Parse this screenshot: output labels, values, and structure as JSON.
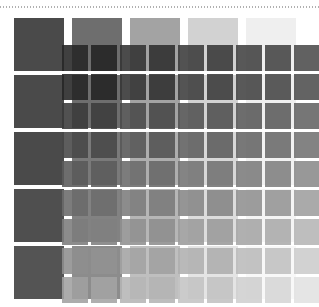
{
  "figure": {
    "background_color": "#ffffff"
  },
  "rule": {
    "name": "dotted-rule",
    "color": "#b0b0b0",
    "y": 6,
    "style": "dotted"
  },
  "chart_data": {
    "type": "heatmap",
    "xlabel": "",
    "ylabel": "",
    "grid": true,
    "legend": null,
    "layers": [
      {
        "name": "coarse",
        "rows": 5,
        "cols": 5,
        "origin_x": 14,
        "origin_y": 18,
        "cell_w": 50,
        "cell_h": 53,
        "gap_x": 8,
        "gap_y": 4,
        "opacity": 1,
        "values": [
          [
            "#4a4a4a",
            "#6e6e6e",
            "#a3a3a3",
            "#d2d2d2",
            "#efefef"
          ],
          [
            "#4a4a4a",
            "#6e6e6e",
            "#a3a3a3",
            "#d2d2d2",
            "#efefef"
          ],
          [
            "#4a4a4a",
            "#7a7a7a",
            "#aeaeae",
            "#d8d8d8",
            "#f2f2f2"
          ],
          [
            "#4f4f4f",
            "#828282",
            "#b6b6b6",
            "#dddddd",
            "#f5f5f5"
          ],
          [
            "#545454",
            "#8c8c8c",
            "#bfbfbf",
            "#e4e4e4",
            "#f8f8f8"
          ]
        ]
      },
      {
        "name": "fine",
        "rows": 9,
        "cols": 9,
        "origin_x": 62,
        "origin_y": 45,
        "cell_w": 26,
        "cell_h": 26,
        "gap_x": 3,
        "gap_y": 3,
        "opacity": 0.88,
        "values": [
          [
            "#262626",
            "#242424",
            "#333333",
            "#2e2e2e",
            "#3b3b3b",
            "#383838",
            "#414141",
            "#444444",
            "#4c4c4c"
          ],
          [
            "#252525",
            "#232323",
            "#343434",
            "#303030",
            "#3d3d3d",
            "#3a3a3a",
            "#434343",
            "#464646",
            "#4e4e4e"
          ],
          [
            "#3a3a3a",
            "#3c3c3c",
            "#4a4a4a",
            "#474747",
            "#525252",
            "#505050",
            "#595959",
            "#5c5c5c",
            "#646464"
          ],
          [
            "#474747",
            "#494949",
            "#575757",
            "#545454",
            "#5f5f5f",
            "#5d5d5d",
            "#666666",
            "#6a6a6a",
            "#727272"
          ],
          [
            "#5a5a5a",
            "#5c5c5c",
            "#6b6b6b",
            "#686868",
            "#747474",
            "#727272",
            "#7c7c7c",
            "#808080",
            "#8a8a8a"
          ],
          [
            "#6b6b6b",
            "#6d6d6d",
            "#7d7d7d",
            "#7a7a7a",
            "#878787",
            "#858585",
            "#909090",
            "#959595",
            "#9f9f9f"
          ],
          [
            "#7d7d7d",
            "#808080",
            "#909090",
            "#8e8e8e",
            "#9c9c9c",
            "#9a9a9a",
            "#a6a6a6",
            "#ababab",
            "#b6b6b6"
          ],
          [
            "#8f8f8f",
            "#929292",
            "#a3a3a3",
            "#a1a1a1",
            "#b0b0b0",
            "#aeaeae",
            "#bbbbbb",
            "#c1c1c1",
            "#cccccc"
          ],
          [
            "#a1a1a1",
            "#a4a4a4",
            "#b6b6b6",
            "#b4b4b4",
            "#c4c4c4",
            "#c2c2c2",
            "#d0d0d0",
            "#d6d6d6",
            "#e2e2e2"
          ]
        ]
      }
    ]
  }
}
